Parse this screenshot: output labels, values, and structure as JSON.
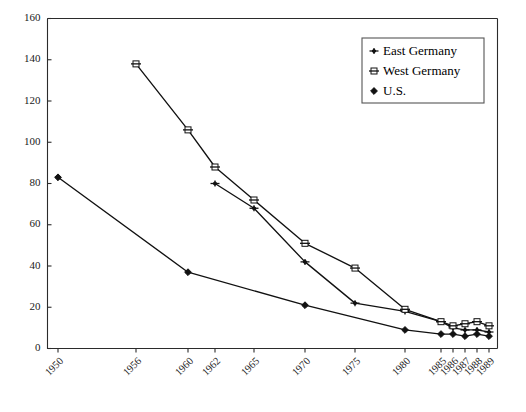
{
  "chart_data": {
    "type": "line",
    "title": "",
    "subtitle": "",
    "xlabel": "",
    "ylabel": "",
    "grid": false,
    "legend_position": "top-right",
    "categories": [
      "1950",
      "1956",
      "1960",
      "1962",
      "1965",
      "1970",
      "1975",
      "1980",
      "1985",
      "1986",
      "1987",
      "1988",
      "1989"
    ],
    "x_tick_labels": [
      "1950",
      "1956",
      "1960",
      "1962",
      "1965",
      "1970",
      "1975",
      "1980",
      "1985",
      "1986",
      "1987",
      "1988",
      "1989"
    ],
    "y_tick_labels": [
      "0",
      "20",
      "40",
      "60",
      "80",
      "100",
      "120",
      "140",
      "160"
    ],
    "y_ticks": [
      0,
      20,
      40,
      60,
      80,
      100,
      120,
      140,
      160
    ],
    "ylim": [
      0,
      160
    ],
    "series": [
      {
        "name": "East Germany",
        "marker": "plus-dot",
        "color": "#111111",
        "points": [
          {
            "x": "1962",
            "y": 80
          },
          {
            "x": "1965",
            "y": 68
          },
          {
            "x": "1970",
            "y": 42
          },
          {
            "x": "1975",
            "y": 22
          },
          {
            "x": "1980",
            "y": 18
          },
          {
            "x": "1985",
            "y": 13
          },
          {
            "x": "1986",
            "y": 10
          },
          {
            "x": "1987",
            "y": 9
          },
          {
            "x": "1988",
            "y": 9
          },
          {
            "x": "1989",
            "y": 8
          }
        ]
      },
      {
        "name": "West Germany",
        "marker": "open-square",
        "color": "#111111",
        "points": [
          {
            "x": "1956",
            "y": 138
          },
          {
            "x": "1960",
            "y": 106
          },
          {
            "x": "1962",
            "y": 88
          },
          {
            "x": "1965",
            "y": 72
          },
          {
            "x": "1970",
            "y": 51
          },
          {
            "x": "1975",
            "y": 39
          },
          {
            "x": "1980",
            "y": 19
          },
          {
            "x": "1985",
            "y": 13
          },
          {
            "x": "1986",
            "y": 11
          },
          {
            "x": "1987",
            "y": 12
          },
          {
            "x": "1988",
            "y": 13
          },
          {
            "x": "1989",
            "y": 11
          }
        ]
      },
      {
        "name": "U.S.",
        "marker": "solid-diamond",
        "color": "#111111",
        "points": [
          {
            "x": "1950",
            "y": 83
          },
          {
            "x": "1960",
            "y": 37
          },
          {
            "x": "1970",
            "y": 21
          },
          {
            "x": "1980",
            "y": 9
          },
          {
            "x": "1985",
            "y": 7
          },
          {
            "x": "1986",
            "y": 7
          },
          {
            "x": "1987",
            "y": 6
          },
          {
            "x": "1988",
            "y": 7
          },
          {
            "x": "1989",
            "y": 6
          }
        ]
      }
    ]
  },
  "legend": {
    "entries": [
      {
        "label": "East Germany",
        "marker": "plus-dot"
      },
      {
        "label": "West Germany",
        "marker": "open-square"
      },
      {
        "label": "U.S.",
        "marker": "solid-diamond"
      }
    ]
  }
}
